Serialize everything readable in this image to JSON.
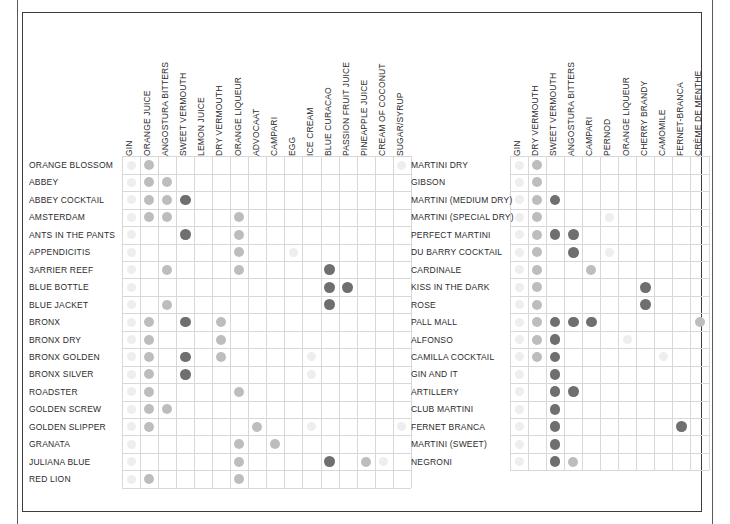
{
  "figure": {
    "type": "dot-matrix",
    "panel_count": 2
  },
  "colors": {
    "frame": "#3c3c3c",
    "edge_line": "#5a5a5a",
    "gridline": "#d8d8d8",
    "text": "#2b2b2b",
    "dot_dark": "#6f6f6f",
    "dot_medium": "#bdbdbd",
    "dot_light": "#dcdcdc",
    "dot_faint": "#eeeeee",
    "background": "#ffffff"
  },
  "chart_data": {
    "type": "heatmap",
    "title": "",
    "xlabel": "",
    "ylabel": "",
    "grid": true,
    "legend": null,
    "panels": [
      {
        "name": "left-panel",
        "columns": [
          "GIN",
          "ORANGE JUICE",
          "ANGOSTURA BITTERS",
          "SWEET VERMOUTH",
          "LEMON JUICE",
          "DRY VERMOUTH",
          "ORANGE LIQUEUR",
          "ADVOCAAT",
          "CAMPARI",
          "EGG",
          "ICE CREAM",
          "BLUE CURACAO",
          "PASSION FRUIT JUICE",
          "PINEAPPLE JUICE",
          "CREAM OF COCONUT",
          "SUGAR/SYRUP"
        ],
        "rows": [
          "ORANGE BLOSSOM",
          "ABBEY",
          "ABBEY COCKTAIL",
          "AMSTERDAM",
          "ANTS IN THE PANTS",
          "APPENDICITIS",
          "3ARRIER REEF",
          "BLUE BOTTLE",
          "BLUE JACKET",
          "BRONX",
          "BRONX DRY",
          "BRONX GOLDEN",
          "BRONX SILVER",
          "ROADSTER",
          "GOLDEN SCREW",
          "GOLDEN SLIPPER",
          "GRANATA",
          "JULIANA BLUE",
          "RED LION"
        ],
        "values": [
          [
            1,
            2,
            0,
            0,
            0,
            0,
            0,
            0,
            0,
            0,
            0,
            0,
            0,
            0,
            0,
            1
          ],
          [
            1,
            2,
            2,
            0,
            0,
            0,
            0,
            0,
            0,
            0,
            0,
            0,
            0,
            0,
            0,
            0
          ],
          [
            1,
            2,
            2,
            3,
            0,
            0,
            0,
            0,
            0,
            0,
            0,
            0,
            0,
            0,
            0,
            0
          ],
          [
            1,
            2,
            2,
            0,
            0,
            0,
            2,
            0,
            0,
            0,
            0,
            0,
            0,
            0,
            0,
            0
          ],
          [
            1,
            0,
            0,
            3,
            0,
            0,
            2,
            0,
            0,
            0,
            0,
            0,
            0,
            0,
            0,
            0
          ],
          [
            1,
            0,
            0,
            0,
            0,
            0,
            2,
            0,
            0,
            1,
            0,
            0,
            0,
            0,
            0,
            0
          ],
          [
            1,
            0,
            2,
            0,
            0,
            0,
            2,
            0,
            0,
            0,
            0,
            3,
            0,
            0,
            0,
            0
          ],
          [
            1,
            0,
            0,
            0,
            0,
            0,
            0,
            0,
            0,
            0,
            0,
            3,
            3,
            0,
            0,
            0
          ],
          [
            1,
            0,
            2,
            0,
            0,
            0,
            0,
            0,
            0,
            0,
            0,
            3,
            0,
            0,
            0,
            0
          ],
          [
            1,
            2,
            0,
            3,
            0,
            2,
            0,
            0,
            0,
            0,
            0,
            0,
            0,
            0,
            0,
            0
          ],
          [
            1,
            2,
            0,
            0,
            0,
            2,
            0,
            0,
            0,
            0,
            0,
            0,
            0,
            0,
            0,
            0
          ],
          [
            1,
            2,
            0,
            3,
            0,
            2,
            0,
            0,
            0,
            0,
            1,
            0,
            0,
            0,
            0,
            0
          ],
          [
            1,
            2,
            0,
            3,
            0,
            0,
            0,
            0,
            0,
            0,
            1,
            0,
            0,
            0,
            0,
            0
          ],
          [
            1,
            2,
            0,
            0,
            0,
            0,
            2,
            0,
            0,
            0,
            0,
            0,
            0,
            0,
            0,
            0
          ],
          [
            1,
            2,
            2,
            0,
            0,
            0,
            0,
            0,
            0,
            0,
            0,
            0,
            0,
            0,
            0,
            0
          ],
          [
            1,
            2,
            0,
            0,
            0,
            0,
            0,
            2,
            0,
            0,
            1,
            0,
            0,
            0,
            0,
            1
          ],
          [
            1,
            0,
            0,
            0,
            0,
            0,
            2,
            0,
            2,
            0,
            0,
            0,
            0,
            0,
            0,
            0
          ],
          [
            1,
            0,
            0,
            0,
            0,
            0,
            2,
            0,
            0,
            0,
            0,
            3,
            0,
            2,
            1,
            0
          ],
          [
            1,
            2,
            0,
            0,
            0,
            0,
            2,
            0,
            0,
            0,
            0,
            0,
            0,
            0,
            0,
            0
          ]
        ],
        "value_legend": {
          "0": "absent",
          "1": "faint",
          "2": "medium",
          "3": "dark"
        }
      },
      {
        "name": "right-panel",
        "columns": [
          "GIN",
          "DRY VERMOUTH",
          "SWEET VERMOUTH",
          "ANGOSTURA BITTERS",
          "CAMPARI",
          "PERNOD",
          "ORANGE LIQUEUR",
          "CHERRY BRANDY",
          "CAMOMILE",
          "FERNET-BRANCA",
          "CRÈME DE MENTHE"
        ],
        "rows": [
          "MARTINI DRY",
          "GIBSON",
          "MARTINI (MEDIUM DRY)",
          "MARTINI (SPECIAL DRY)",
          "PERFECT MARTINI",
          "DU BARRY COCKTAIL",
          "CARDINALE",
          "KISS IN THE DARK",
          "ROSE",
          "PALL MALL",
          "ALFONSO",
          "CAMILLA COCKTAIL",
          "GIN AND IT",
          "ARTILLERY",
          "CLUB MARTINI",
          "FERNET BRANCA",
          "MARTINI (SWEET)",
          "NEGRONI"
        ],
        "values": [
          [
            1,
            2,
            0,
            0,
            0,
            0,
            0,
            0,
            0,
            0,
            0
          ],
          [
            1,
            2,
            0,
            0,
            0,
            0,
            0,
            0,
            0,
            0,
            0
          ],
          [
            1,
            2,
            3,
            0,
            0,
            0,
            0,
            0,
            0,
            0,
            0
          ],
          [
            1,
            2,
            0,
            0,
            0,
            1,
            0,
            0,
            0,
            0,
            0
          ],
          [
            1,
            2,
            3,
            3,
            0,
            0,
            0,
            0,
            0,
            0,
            0
          ],
          [
            1,
            2,
            0,
            3,
            0,
            1,
            0,
            0,
            0,
            0,
            0
          ],
          [
            1,
            2,
            0,
            0,
            2,
            0,
            0,
            0,
            0,
            0,
            0
          ],
          [
            1,
            2,
            0,
            0,
            0,
            0,
            0,
            3,
            0,
            0,
            0
          ],
          [
            1,
            2,
            0,
            0,
            0,
            0,
            0,
            3,
            0,
            0,
            0
          ],
          [
            1,
            2,
            3,
            3,
            3,
            0,
            0,
            0,
            0,
            0,
            2
          ],
          [
            1,
            2,
            3,
            0,
            0,
            0,
            1,
            0,
            0,
            0,
            0
          ],
          [
            1,
            2,
            3,
            0,
            0,
            0,
            0,
            0,
            1,
            0,
            0
          ],
          [
            1,
            0,
            3,
            0,
            0,
            0,
            0,
            0,
            0,
            0,
            0
          ],
          [
            1,
            0,
            3,
            3,
            0,
            0,
            0,
            0,
            0,
            0,
            0
          ],
          [
            1,
            0,
            3,
            0,
            0,
            0,
            0,
            0,
            0,
            0,
            0
          ],
          [
            1,
            0,
            3,
            0,
            0,
            0,
            0,
            0,
            0,
            3,
            0
          ],
          [
            1,
            0,
            3,
            0,
            0,
            0,
            0,
            0,
            0,
            0,
            0
          ],
          [
            1,
            0,
            3,
            2,
            0,
            0,
            0,
            0,
            0,
            0,
            0
          ]
        ],
        "value_legend": {
          "0": "absent",
          "1": "faint",
          "2": "medium",
          "3": "dark"
        }
      }
    ]
  }
}
